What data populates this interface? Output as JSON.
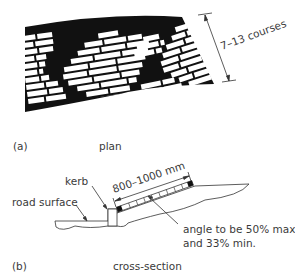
{
  "figure": {
    "part_a": {
      "letter": "(a)",
      "caption": "plan",
      "dimension_label": "7–13 courses"
    },
    "part_b": {
      "letter": "(b)",
      "caption": "cross-section",
      "labels": {
        "kerb": "kerb",
        "road_surface": "road surface",
        "length": "800–1000 mm",
        "angle_line1": "angle to be 50% max.",
        "angle_line2": "and 33% min."
      }
    }
  }
}
